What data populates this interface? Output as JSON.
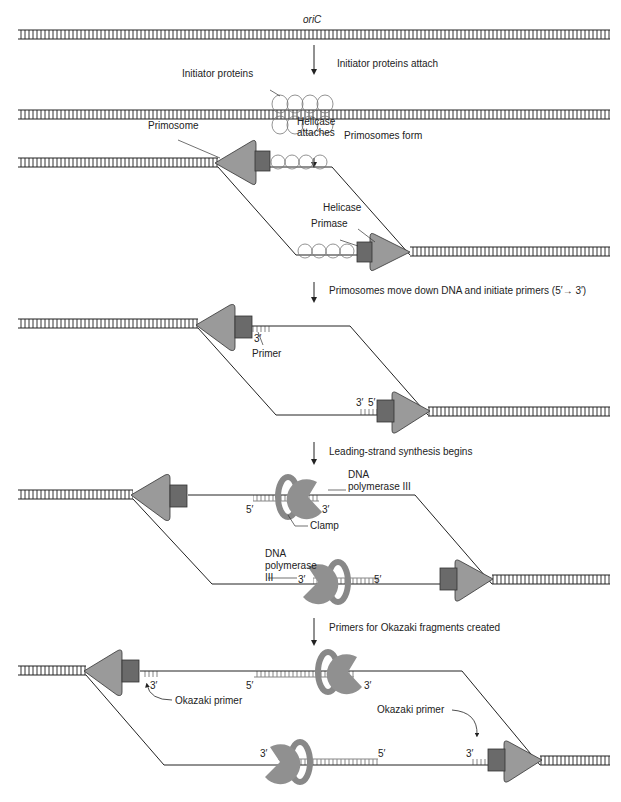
{
  "diagram": {
    "colors": {
      "background": "#ffffff",
      "dna_line": "#222222",
      "protein_fill": "#9a9a9a",
      "protein_dark": "#6a6a6a",
      "primer": "#8a8a8a"
    },
    "stage1": {
      "origin_label": "oriC",
      "step": "Initiator proteins attach"
    },
    "stage2": {
      "initiator_label": "Initiator proteins",
      "helicase_label_1": "Helicase",
      "helicase_label_2": "attaches",
      "step": "Primosomes form"
    },
    "stage3": {
      "primosome_label": "Primosome",
      "helicase_label": "Helicase",
      "primase_label": "Primase",
      "step": "Primosomes move down DNA and initiate primers (5′→ 3′)"
    },
    "stage4": {
      "three_prime_top": "3′",
      "primer_label": "Primer",
      "three_prime_bottom": "3′",
      "five_prime_bottom": "5′",
      "step": "Leading-strand synthesis begins"
    },
    "stage5": {
      "pol_top_1": "DNA",
      "pol_top_2": "polymerase III",
      "five_prime_top": "5′",
      "three_prime_top": "3′",
      "clamp_label": "Clamp",
      "pol_bot_1": "DNA",
      "pol_bot_2": "polymerase",
      "pol_bot_3": "III",
      "three_prime_bottom": "3′",
      "five_prime_bottom": "5′",
      "step": "Primers for Okazaki fragments created"
    },
    "stage6": {
      "three_prime_left": "3′",
      "five_prime_top": "5′",
      "three_prime_top": "3′",
      "okazaki_left": "Okazaki primer",
      "okazaki_right": "Okazaki primer",
      "three_prime_bot_left": "3′",
      "five_prime_bot": "5′",
      "three_prime_bot_right": "3′"
    }
  }
}
